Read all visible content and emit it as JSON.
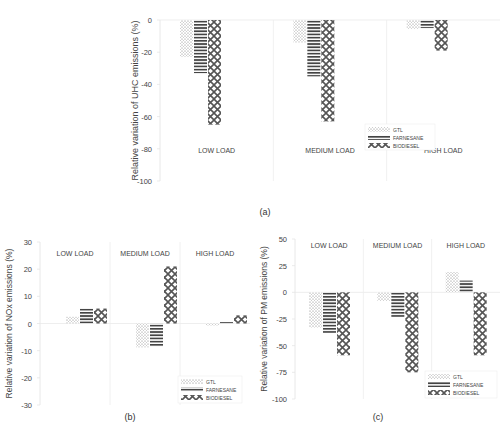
{
  "figure": {
    "captions": [
      "(a)",
      "(b)",
      "(c)"
    ]
  },
  "legend": {
    "entries": [
      "GTL",
      "FARNESANE",
      "BIODIESEL"
    ]
  },
  "chart_data": [
    {
      "id": "a",
      "type": "bar",
      "title": "",
      "xlabel": "",
      "ylabel": "Relative variation of UHC emissions (%)",
      "categories": [
        "LOW LOAD",
        "MEDIUM LOAD",
        "HIGH LOAD"
      ],
      "series": [
        {
          "name": "GTL",
          "values": [
            -23,
            -14,
            -5.5
          ]
        },
        {
          "name": "FARNESANE",
          "values": [
            -33,
            -35,
            -5
          ]
        },
        {
          "name": "BIODIESEL",
          "values": [
            -65,
            -63,
            -19
          ]
        }
      ],
      "ylim": [
        -100,
        0
      ],
      "yticks": [
        0,
        -20,
        -40,
        -60,
        -80,
        -100
      ],
      "grid": false,
      "legend_position": "lower right (in HIGH LOAD panel)",
      "category_label_position": "bottom"
    },
    {
      "id": "b",
      "type": "bar",
      "title": "",
      "xlabel": "",
      "ylabel": "Relative variation of NOx emissions (%)",
      "categories": [
        "LOW LOAD",
        "MEDIUM LOAD",
        "HIGH LOAD"
      ],
      "series": [
        {
          "name": "GTL",
          "values": [
            2.5,
            -8.8,
            -0.8
          ]
        },
        {
          "name": "FARNESANE",
          "values": [
            5.5,
            -8.5,
            0.5
          ]
        },
        {
          "name": "BIODIESEL",
          "values": [
            5.5,
            21,
            3
          ]
        }
      ],
      "ylim": [
        -30,
        30
      ],
      "yticks": [
        30,
        20,
        10,
        0,
        -10,
        -20,
        -30
      ],
      "grid": false,
      "legend_position": "lower right (in HIGH LOAD panel)",
      "category_label_position": "top"
    },
    {
      "id": "c",
      "type": "bar",
      "title": "",
      "xlabel": "",
      "ylabel": "Relative variation of PM emissions (%)",
      "categories": [
        "LOW LOAD",
        "MEDIUM LOAD",
        "HIGH LOAD"
      ],
      "series": [
        {
          "name": "GTL",
          "values": [
            -33,
            -8,
            19
          ]
        },
        {
          "name": "FARNESANE",
          "values": [
            -38,
            -23,
            11
          ]
        },
        {
          "name": "BIODIESEL",
          "values": [
            -59,
            -75,
            -59
          ]
        }
      ],
      "ylim": [
        -100,
        50
      ],
      "yticks": [
        50,
        25,
        0,
        -25,
        -50,
        -75,
        -100
      ],
      "grid": false,
      "legend_position": "lower right (in HIGH LOAD panel)",
      "category_label_position": "top"
    }
  ]
}
